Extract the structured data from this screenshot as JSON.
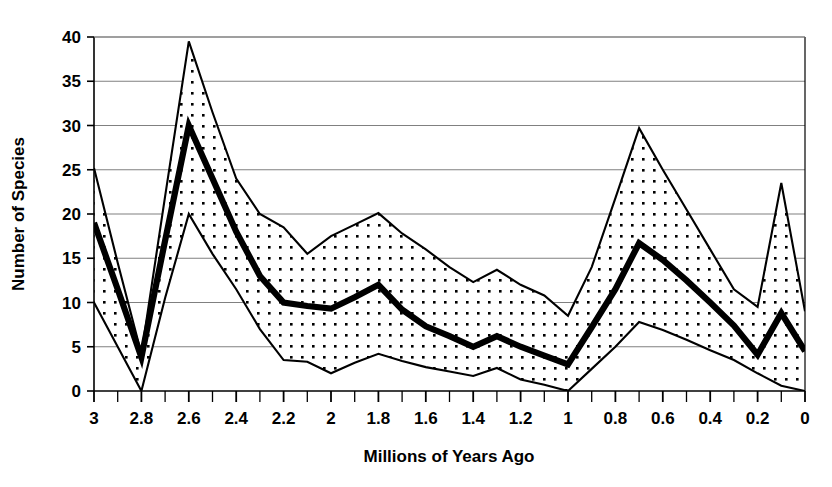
{
  "chart_data": {
    "type": "area",
    "title": "",
    "subtitle": "",
    "xlabel": "Millions of Years Ago",
    "ylabel": "Number of Species",
    "xlim": [
      3,
      0
    ],
    "ylim": [
      0,
      40
    ],
    "x_reversed": true,
    "grid": true,
    "grid_axis": "y",
    "legend": "none",
    "x_major_step": 0.2,
    "x_minor_step": 0.1,
    "y_major_step": 5,
    "xticks": [
      "3",
      "2.8",
      "2.6",
      "2.4",
      "2.2",
      "2",
      "1.8",
      "1.6",
      "1.4",
      "1.2",
      "1",
      "0.8",
      "0.6",
      "0.4",
      "0.2",
      "0"
    ],
    "xtick_values": [
      3,
      2.8,
      2.6,
      2.4,
      2.2,
      2,
      1.8,
      1.6,
      1.4,
      1.2,
      1,
      0.8,
      0.6,
      0.4,
      0.2,
      0
    ],
    "yticks": [
      "0",
      "5",
      "10",
      "15",
      "20",
      "25",
      "30",
      "35",
      "40"
    ],
    "ytick_values": [
      0,
      5,
      10,
      15,
      20,
      25,
      30,
      35,
      40
    ],
    "x": [
      3,
      2.9,
      2.8,
      2.7,
      2.6,
      2.5,
      2.4,
      2.3,
      2.2,
      2.1,
      2,
      1.9,
      1.8,
      1.7,
      1.6,
      1.5,
      1.4,
      1.3,
      1.2,
      1.1,
      1,
      0.9,
      0.8,
      0.7,
      0.6,
      0.5,
      0.4,
      0.3,
      0.2,
      0.1,
      0
    ],
    "series": [
      {
        "name": "Upper bound",
        "role": "upper",
        "style": "thin-line",
        "values": [
          25.2,
          14.5,
          4.2,
          22,
          39.5,
          31.5,
          24,
          20,
          18.5,
          15.5,
          17.5,
          18.8,
          20.1,
          17.8,
          16,
          14,
          12.3,
          13.7,
          12,
          10.8,
          8.5,
          14,
          21.8,
          29.7,
          25,
          20.5,
          16,
          11.5,
          9.5,
          23.5,
          9
        ]
      },
      {
        "name": "Mean number of species",
        "role": "middle",
        "style": "thick-line",
        "values": [
          19,
          11.5,
          3.8,
          17,
          30,
          24,
          18,
          13,
          10,
          9.6,
          9.3,
          10.6,
          12,
          9.2,
          7.3,
          6.2,
          5,
          6.2,
          5,
          4,
          3,
          7.2,
          11.5,
          16.7,
          14.8,
          12.5,
          10,
          7.4,
          4.1,
          8.8,
          4.5
        ]
      },
      {
        "name": "Lower bound",
        "role": "lower",
        "style": "thin-line",
        "values": [
          10,
          5,
          0,
          10.5,
          20,
          15.5,
          11.5,
          7,
          3.5,
          3.3,
          2,
          3.2,
          4.2,
          3.4,
          2.7,
          2.2,
          1.7,
          2.6,
          1.3,
          0.7,
          0,
          2.5,
          5,
          7.8,
          6.9,
          5.8,
          4.6,
          3.5,
          2,
          0.6,
          0
        ]
      }
    ],
    "colors": {
      "band_fill": "#ffffff",
      "band_pattern": "#000000",
      "line": "#000000",
      "grid": "#808080",
      "axis": "#000000",
      "text": "#000000"
    }
  }
}
